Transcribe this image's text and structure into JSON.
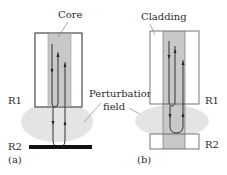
{
  "figure": {
    "panels": [
      {
        "id": "a",
        "caption": "(a)",
        "labels": {
          "core": "Core",
          "region1": "R1",
          "region2": "R2"
        },
        "region2_type": "reflector-plate"
      },
      {
        "id": "b",
        "caption": "(b)",
        "labels": {
          "cladding": "Cladding",
          "region1": "R1",
          "region2": "R2"
        },
        "region2_type": "fiber-segment"
      }
    ],
    "shared_labels": {
      "perturbation_line1": "Perturbation",
      "perturbation_line2": "field"
    },
    "colors": {
      "core_fill": "#c8c8c8",
      "cladding_fill": "#ffffff",
      "outline": "#555555",
      "perturbation_fill": "#e4e4e4",
      "reflector": "#111111",
      "ray": "#333333"
    }
  }
}
